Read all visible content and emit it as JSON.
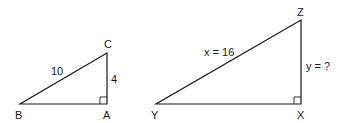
{
  "diagram": {
    "type": "similar-right-triangles",
    "triangles": [
      {
        "name": "ABC",
        "vertices": {
          "B": "B",
          "A": "A",
          "C": "C"
        },
        "right_angle_at": "A",
        "sides": {
          "hypotenuse_BC": "10",
          "leg_AC": "4"
        }
      },
      {
        "name": "XYZ",
        "vertices": {
          "Y": "Y",
          "X": "X",
          "Z": "Z"
        },
        "right_angle_at": "X",
        "sides": {
          "hypotenuse_YZ": "x = 16",
          "leg_XZ": "y = ?"
        }
      }
    ]
  },
  "labels": {
    "t1": {
      "B": "B",
      "A": "A",
      "C": "C",
      "hyp": "10",
      "leg": "4"
    },
    "t2": {
      "Y": "Y",
      "X": "X",
      "Z": "Z",
      "hyp": "x = 16",
      "leg": "y = ?"
    }
  },
  "colors": {
    "stroke": "#1a1a1a",
    "background": "#ffffff"
  }
}
